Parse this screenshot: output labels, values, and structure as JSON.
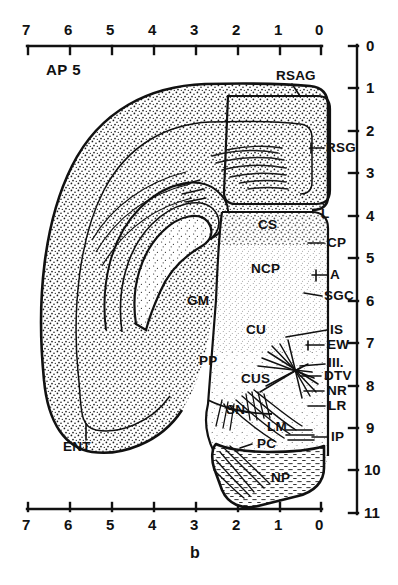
{
  "figure": {
    "panel_letter": "b",
    "section_label": "AP 5",
    "width": 398,
    "height": 585,
    "ink_color": "#111111",
    "background_color": "#ffffff"
  },
  "scales": {
    "top_axis": {
      "orientation": "horizontal",
      "ticks": [
        "7",
        "6",
        "5",
        "4",
        "3",
        "2",
        "1",
        "0"
      ],
      "direction": "right-to-left-decreasing"
    },
    "bottom_axis": {
      "orientation": "horizontal",
      "ticks": [
        "7",
        "6",
        "5",
        "4",
        "3",
        "2",
        "1",
        "0"
      ],
      "direction": "right-to-left-decreasing"
    },
    "right_axis": {
      "orientation": "vertical",
      "ticks": [
        "0",
        "1",
        "2",
        "3",
        "4",
        "5",
        "6",
        "7",
        "8",
        "9",
        "10",
        "11"
      ],
      "direction": "top-to-bottom-increasing"
    }
  },
  "structure_labels": {
    "interior": [
      {
        "text": "CS",
        "x": 258,
        "y": 225
      },
      {
        "text": "NCP",
        "x": 251,
        "y": 269
      },
      {
        "text": "GM",
        "x": 187,
        "y": 301
      },
      {
        "text": "CU",
        "x": 246,
        "y": 330
      },
      {
        "text": "PP",
        "x": 199,
        "y": 361
      },
      {
        "text": "CUS",
        "x": 241,
        "y": 379
      },
      {
        "text": "SN",
        "x": 226,
        "y": 410
      },
      {
        "text": "LM",
        "x": 267,
        "y": 427
      },
      {
        "text": "PC",
        "x": 257,
        "y": 444
      },
      {
        "text": "NP",
        "x": 271,
        "y": 478
      },
      {
        "text": "ENT",
        "x": 63,
        "y": 447
      }
    ],
    "right_margin": [
      {
        "text": "RSAG",
        "x": 276,
        "y": 76
      },
      {
        "text": "RSG",
        "x": 326,
        "y": 148
      },
      {
        "text": "L",
        "x": 321,
        "y": 215
      },
      {
        "text": "CP",
        "x": 327,
        "y": 243
      },
      {
        "text": "A",
        "x": 330,
        "y": 275
      },
      {
        "text": "SGC",
        "x": 324,
        "y": 296
      },
      {
        "text": "IS",
        "x": 330,
        "y": 330
      },
      {
        "text": "EW",
        "x": 327,
        "y": 345
      },
      {
        "text": "III.",
        "x": 328,
        "y": 363
      },
      {
        "text": "DTV",
        "x": 324,
        "y": 376
      },
      {
        "text": "NR",
        "x": 327,
        "y": 391
      },
      {
        "text": "LR",
        "x": 328,
        "y": 406
      },
      {
        "text": "IP",
        "x": 331,
        "y": 437
      }
    ]
  }
}
